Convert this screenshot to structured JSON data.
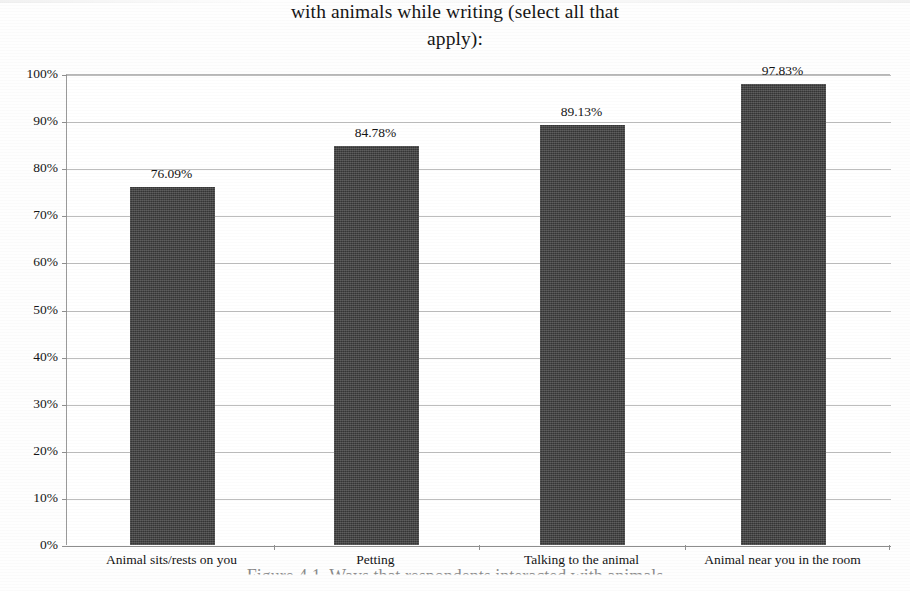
{
  "document": {
    "footer_artifact_text": "Figure 4.1. Ways that respondents interacted with animals"
  },
  "chart_data": {
    "type": "bar",
    "title": "with animals while writing (select all that apply):",
    "title_lines": [
      "with animals while writing (select all that",
      "apply):"
    ],
    "xlabel": "",
    "ylabel": "",
    "categories": [
      "Animal sits/rests on you",
      "Petting",
      "Talking to the animal",
      "Animal near you in the room"
    ],
    "values": [
      76.09,
      84.78,
      89.13,
      97.83
    ],
    "value_labels": [
      "76.09%",
      "84.78%",
      "89.13%",
      "97.83%"
    ],
    "ylim": [
      0,
      100
    ],
    "ytick_values": [
      0,
      10,
      20,
      30,
      40,
      50,
      60,
      70,
      80,
      90,
      100
    ],
    "ytick_labels": [
      "0%",
      "10%",
      "20%",
      "30%",
      "40%",
      "50%",
      "60%",
      "70%",
      "80%",
      "90%",
      "100%"
    ],
    "grid": true,
    "legend": false,
    "series_color": "#3f3f3f",
    "gridline_color": "#bdbdbd",
    "axis_color": "#8f8f8f"
  }
}
